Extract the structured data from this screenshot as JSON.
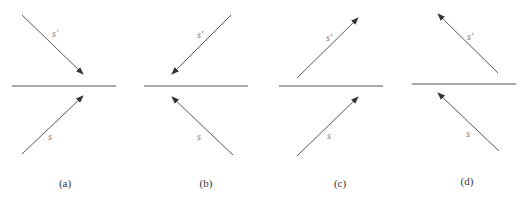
{
  "diagram": {
    "type": "reflection-panels",
    "colors": {
      "line": "#555555",
      "arrow": "#444444",
      "label": "#777777"
    },
    "panels": [
      {
        "id": "a",
        "caption": "(a)",
        "surface": {
          "x1": 12,
          "x2": 116,
          "y": 86
        },
        "upper": {
          "label": "s'",
          "x1": 22,
          "y1": 15,
          "x2": 83,
          "y2": 74,
          "head": "end"
        },
        "lower": {
          "label": "s",
          "x1": 22,
          "y1": 154,
          "x2": 83,
          "y2": 96,
          "head": "end"
        },
        "upper_label_pos": {
          "x": 52,
          "y": 37
        },
        "lower_label_pos": {
          "x": 48,
          "y": 140
        },
        "caption_pos": {
          "x": 65,
          "y": 187
        }
      },
      {
        "id": "b",
        "caption": "(b)",
        "surface": {
          "x1": 144,
          "x2": 248,
          "y": 86
        },
        "upper": {
          "label": "s'",
          "x1": 231,
          "y1": 15,
          "x2": 172,
          "y2": 74,
          "head": "end"
        },
        "lower": {
          "label": "s",
          "x1": 233,
          "y1": 155,
          "x2": 172,
          "y2": 97,
          "head": "end"
        },
        "upper_label_pos": {
          "x": 197,
          "y": 38
        },
        "lower_label_pos": {
          "x": 197,
          "y": 140
        },
        "caption_pos": {
          "x": 206,
          "y": 187
        }
      },
      {
        "id": "c",
        "caption": "(c)",
        "surface": {
          "x1": 279,
          "x2": 383,
          "y": 86
        },
        "upper": {
          "label": "s'",
          "x1": 297,
          "y1": 78,
          "x2": 358,
          "y2": 18,
          "head": "end"
        },
        "lower": {
          "label": "s",
          "x1": 297,
          "y1": 156,
          "x2": 358,
          "y2": 97,
          "head": "end"
        },
        "upper_label_pos": {
          "x": 326,
          "y": 41
        },
        "lower_label_pos": {
          "x": 327,
          "y": 139
        },
        "caption_pos": {
          "x": 340,
          "y": 187
        }
      },
      {
        "id": "d",
        "caption": "(d)",
        "surface": {
          "x1": 412,
          "x2": 516,
          "y": 84
        },
        "upper": {
          "label": "s'",
          "x1": 498,
          "y1": 73,
          "x2": 438,
          "y2": 14,
          "head": "end"
        },
        "lower": {
          "label": "s",
          "x1": 499,
          "y1": 151,
          "x2": 438,
          "y2": 93,
          "head": "end"
        },
        "upper_label_pos": {
          "x": 467,
          "y": 40
        },
        "lower_label_pos": {
          "x": 466,
          "y": 137
        },
        "caption_pos": {
          "x": 467,
          "y": 185
        }
      }
    ]
  }
}
